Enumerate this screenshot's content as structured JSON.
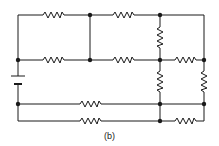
{
  "figure": {
    "caption": "(b)",
    "type": "resistor network circuit diagram",
    "components": {
      "battery_count": 1,
      "resistor_count": 9,
      "node_count": 9
    },
    "colors": {
      "wire": "#1a1a1a",
      "background": "#ffffff"
    }
  }
}
